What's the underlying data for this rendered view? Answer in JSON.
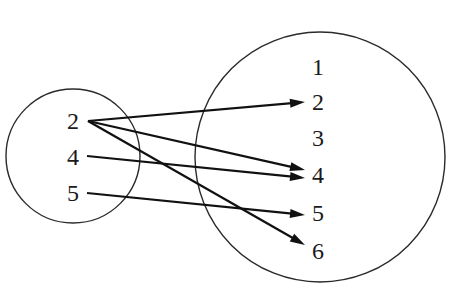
{
  "diagram": {
    "type": "mapping",
    "domain_set": {
      "name": "domain-set",
      "center": [
        73,
        156
      ],
      "radius": 67,
      "elements": [
        {
          "label": "2",
          "x": 73,
          "y": 121
        },
        {
          "label": "4",
          "x": 73,
          "y": 157
        },
        {
          "label": "5",
          "x": 73,
          "y": 193
        }
      ]
    },
    "codomain_set": {
      "name": "codomain-set",
      "center": [
        320,
        157
      ],
      "radius": 125,
      "elements": [
        {
          "label": "1",
          "x": 318,
          "y": 67
        },
        {
          "label": "2",
          "x": 318,
          "y": 102
        },
        {
          "label": "3",
          "x": 318,
          "y": 138
        },
        {
          "label": "4",
          "x": 318,
          "y": 175
        },
        {
          "label": "5",
          "x": 318,
          "y": 213
        },
        {
          "label": "6",
          "x": 318,
          "y": 251
        }
      ]
    },
    "mappings": [
      {
        "from": "2",
        "to": "2",
        "x1": 88,
        "y1": 121,
        "x2": 305,
        "y2": 102
      },
      {
        "from": "2",
        "to": "4",
        "x1": 88,
        "y1": 121,
        "x2": 305,
        "y2": 170
      },
      {
        "from": "2",
        "to": "6",
        "x1": 88,
        "y1": 121,
        "x2": 305,
        "y2": 245
      },
      {
        "from": "4",
        "to": "4",
        "x1": 87,
        "y1": 156,
        "x2": 305,
        "y2": 178
      },
      {
        "from": "5",
        "to": "5",
        "x1": 87,
        "y1": 193,
        "x2": 305,
        "y2": 215
      }
    ],
    "colors": {
      "stroke": "#111111",
      "circle": "#2a2a2a",
      "background": "#ffffff"
    }
  }
}
